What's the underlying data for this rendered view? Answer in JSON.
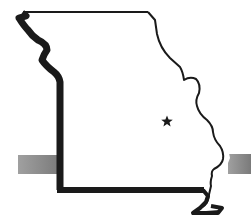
{
  "map": {
    "subject": "Missouri state outline",
    "marker": {
      "type": "star",
      "label": "Capital",
      "x": 167,
      "y": 121
    },
    "band": {
      "color": "#8a8a8a",
      "y_top": 155,
      "y_bottom": 174
    },
    "colors": {
      "outline": "#1a1a1a",
      "fill": "#ffffff",
      "band": "#8a8a8a",
      "background": "#ffffff"
    }
  }
}
